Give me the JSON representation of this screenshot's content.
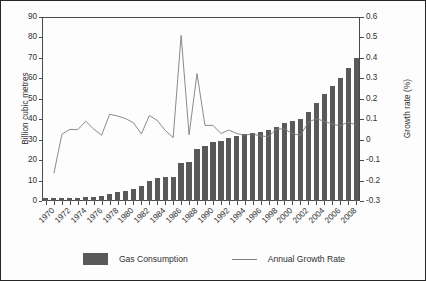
{
  "chart_data": {
    "type": "bar",
    "title": "",
    "xlabel": "",
    "ylabel": "Billion cubic metres",
    "y2label": "Growth rate (%)",
    "ylim": [
      0,
      90
    ],
    "y2lim": [
      -0.3,
      0.6
    ],
    "grid": false,
    "legend_position": "bottom",
    "x": [
      1970,
      1971,
      1972,
      1973,
      1974,
      1975,
      1976,
      1977,
      1978,
      1979,
      1980,
      1981,
      1982,
      1983,
      1984,
      1985,
      1986,
      1987,
      1988,
      1989,
      1990,
      1991,
      1992,
      1993,
      1994,
      1995,
      1996,
      1997,
      1998,
      1999,
      2000,
      2001,
      2002,
      2003,
      2004,
      2005,
      2006,
      2007,
      2008,
      2009
    ],
    "categories": [
      "1970",
      "1971",
      "1972",
      "1973",
      "1974",
      "1975",
      "1976",
      "1977",
      "1978",
      "1979",
      "1980",
      "1981",
      "1982",
      "1983",
      "1984",
      "1985",
      "1986",
      "1987",
      "1988",
      "1989",
      "1990",
      "1991",
      "1992",
      "1993",
      "1994",
      "1995",
      "1996",
      "1997",
      "1998",
      "1999",
      "2000",
      "2001",
      "2002",
      "2003",
      "2004",
      "2005",
      "2006",
      "2007",
      "2008",
      "2009"
    ],
    "xtick_labels": [
      "1970",
      "1972",
      "1974",
      "1976",
      "1978",
      "1980",
      "1982",
      "1984",
      "1986",
      "1988",
      "1990",
      "1992",
      "1994",
      "1996",
      "1998",
      "2000",
      "2002",
      "2004",
      "2006",
      "2008"
    ],
    "ytick_labels": [
      "0",
      "10",
      "20",
      "30",
      "40",
      "50",
      "60",
      "70",
      "80",
      "90"
    ],
    "ytick_values": [
      0,
      10,
      20,
      30,
      40,
      50,
      60,
      70,
      80,
      90
    ],
    "y2tick_labels": [
      "-0.3",
      "-0.2",
      "-0.1",
      "0",
      "0.1",
      "0.2",
      "0.3",
      "0.4",
      "0.5",
      "0.6"
    ],
    "y2tick_values": [
      -0.3,
      -0.2,
      -0.1,
      0,
      0.1,
      0.2,
      0.3,
      0.4,
      0.5,
      0.6
    ],
    "series": [
      {
        "name": "Gas Consumption",
        "type": "bar",
        "axis": "left",
        "color": "#595959",
        "values": [
          1.4,
          1.3,
          1.3,
          1.5,
          1.6,
          1.9,
          2.1,
          2.4,
          3.3,
          4.2,
          5.0,
          5.9,
          7.4,
          9.6,
          11.2,
          11.9,
          11.6,
          18.4,
          18.9,
          25.4,
          27.0,
          29.0,
          29.6,
          31.0,
          31.9,
          32.6,
          33.5,
          34.0,
          34.5,
          36.3,
          38.2,
          39.3,
          40.1,
          43.5,
          48.0,
          52.3,
          56.3,
          60.1,
          65.3,
          70.0
        ]
      },
      {
        "name": "Annual Growth Rate",
        "type": "line",
        "axis": "right",
        "color": "#7d7d7d",
        "values": [
          null,
          -0.165,
          0.027,
          0.05,
          0.049,
          0.09,
          0.052,
          0.022,
          0.124,
          0.116,
          0.103,
          0.083,
          0.028,
          0.118,
          0.094,
          0.045,
          0.01,
          0.51,
          0.024,
          0.323,
          0.07,
          0.07,
          0.03,
          0.047,
          0.03,
          0.022,
          0.028,
          0.018,
          0.015,
          0.052,
          0.053,
          0.029,
          0.021,
          0.085,
          0.103,
          0.09,
          0.077,
          0.067,
          0.087,
          0.072
        ]
      }
    ]
  },
  "legend": {
    "items": [
      {
        "label": "Gas Consumption",
        "marker": "square"
      },
      {
        "label": "Annual Growth Rate",
        "marker": "line"
      }
    ]
  },
  "colors": {
    "bar": "#595959",
    "line": "#7d7d7d",
    "axis": "#4a4a4a",
    "text": "#303030",
    "background": "#ffffff",
    "border": "#262626"
  }
}
